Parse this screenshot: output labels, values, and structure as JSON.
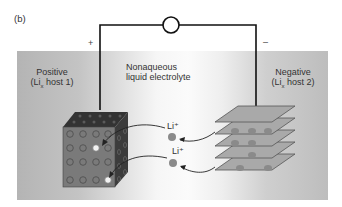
{
  "panel_label": "(b)",
  "voltmeter": {
    "symbol": "V"
  },
  "terminals": {
    "positive_sign": "+",
    "negative_sign": "–"
  },
  "labels": {
    "positive_line1": "Positive",
    "positive_line2_prefix": "(Li",
    "positive_line2_sub": "x",
    "positive_line2_suffix": " host 1)",
    "electrolyte_line1": "Nonaqueous",
    "electrolyte_line2": "liquid electrolyte",
    "negative_line1": "Negative",
    "negative_line2_prefix": "(Li",
    "negative_line2_sub": "x",
    "negative_line2_suffix": " host 2)"
  },
  "ions": [
    {
      "label": "Li⁺"
    },
    {
      "label": "Li⁺"
    }
  ],
  "colors": {
    "wire": "#111111",
    "cube_front": "#7a7a7a",
    "cube_side": "#3c3c3c",
    "plate": "#a9a9a9",
    "ion": "#8a8a8a"
  }
}
